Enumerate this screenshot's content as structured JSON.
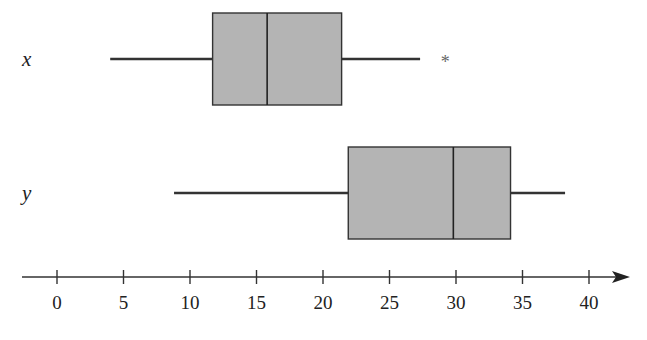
{
  "chart_data": {
    "type": "boxplot",
    "title": "",
    "xlabel": "",
    "ylabel": "",
    "xlim": [
      0,
      40
    ],
    "xticks": [
      0,
      5,
      10,
      15,
      20,
      25,
      30,
      35,
      40
    ],
    "grid": false,
    "legend": "none",
    "box_fill": "#b4b4b4",
    "line_color": "#333333",
    "series": [
      {
        "name": "x",
        "whisker_low": 4,
        "q1": 11.7,
        "median": 15.8,
        "q3": 21.4,
        "whisker_high": 27.3,
        "outliers": [
          29.2
        ],
        "outlier_marker": "*"
      },
      {
        "name": "y",
        "whisker_low": 8.8,
        "q1": 21.9,
        "median": 29.8,
        "q3": 34.1,
        "whisker_high": 38.2,
        "outliers": []
      }
    ]
  }
}
